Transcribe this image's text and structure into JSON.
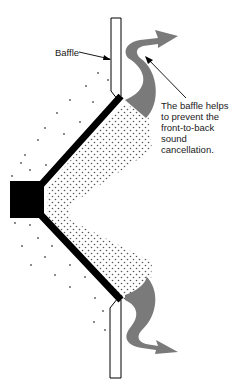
{
  "diagram": {
    "labels": {
      "baffle": "Baffle",
      "caption_lines": [
        "The baffle helps",
        "to prevent the",
        "front-to-back",
        "sound",
        "cancellation."
      ]
    },
    "elements": [
      {
        "name": "baffle-top",
        "shape": "rectangle-with-chamfer"
      },
      {
        "name": "baffle-bottom",
        "shape": "rectangle-with-chamfer"
      },
      {
        "name": "speaker-magnet",
        "shape": "black-square"
      },
      {
        "name": "speaker-cone",
        "shape": "black-v-lines"
      },
      {
        "name": "front-sound-stipple",
        "shape": "dense-dots"
      },
      {
        "name": "rear-sound-stipple",
        "shape": "sparse-dots"
      },
      {
        "name": "sound-path-arrow-top",
        "shape": "gray-curved-arrow"
      },
      {
        "name": "sound-path-arrow-bottom",
        "shape": "gray-curved-arrow"
      }
    ],
    "colors": {
      "ink": "#000000",
      "arrow_gray": "#7a7a7a",
      "background": "#ffffff"
    }
  }
}
